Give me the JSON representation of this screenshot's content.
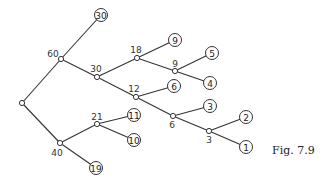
{
  "caption": "Fig. 7.9",
  "nodes": [
    {
      "id": "root",
      "type": "inner",
      "x": 22,
      "y": 103,
      "label": "",
      "lx": 0,
      "ly": 0
    },
    {
      "id": "n60",
      "type": "inner",
      "x": 61,
      "y": 59,
      "label": "60",
      "lx": 53,
      "ly": 57
    },
    {
      "id": "n30",
      "type": "inner",
      "x": 97,
      "y": 77,
      "label": "30",
      "lx": 96,
      "ly": 72
    },
    {
      "id": "n18",
      "type": "inner",
      "x": 137,
      "y": 58,
      "label": "18",
      "lx": 136,
      "ly": 53
    },
    {
      "id": "n9",
      "type": "inner",
      "x": 175,
      "y": 71,
      "label": "9",
      "lx": 175,
      "ly": 67
    },
    {
      "id": "n12",
      "type": "inner",
      "x": 136,
      "y": 97,
      "label": "12",
      "lx": 134,
      "ly": 92
    },
    {
      "id": "n6",
      "type": "inner",
      "x": 173,
      "y": 116,
      "label": "6",
      "lx": 172,
      "ly": 128
    },
    {
      "id": "n3",
      "type": "inner",
      "x": 209,
      "y": 131,
      "label": "3",
      "lx": 209,
      "ly": 143
    },
    {
      "id": "n40",
      "type": "inner",
      "x": 60,
      "y": 143,
      "label": "40",
      "lx": 57,
      "ly": 156
    },
    {
      "id": "n21",
      "type": "inner",
      "x": 97,
      "y": 124,
      "label": "21",
      "lx": 97,
      "ly": 120
    },
    {
      "id": "l30",
      "type": "leaf",
      "x": 101,
      "y": 15,
      "label": "30"
    },
    {
      "id": "l9",
      "type": "leaf",
      "x": 175,
      "y": 40,
      "label": "9"
    },
    {
      "id": "l5",
      "type": "leaf",
      "x": 212,
      "y": 53,
      "label": "5"
    },
    {
      "id": "l4",
      "type": "leaf",
      "x": 210,
      "y": 83,
      "label": "4"
    },
    {
      "id": "l6",
      "type": "leaf",
      "x": 174,
      "y": 86,
      "label": "6"
    },
    {
      "id": "l3",
      "type": "leaf",
      "x": 210,
      "y": 106,
      "label": "3"
    },
    {
      "id": "l2",
      "type": "leaf",
      "x": 246,
      "y": 117,
      "label": "2"
    },
    {
      "id": "l1",
      "type": "leaf",
      "x": 246,
      "y": 147,
      "label": "1"
    },
    {
      "id": "l11",
      "type": "leaf",
      "x": 134,
      "y": 115,
      "label": "11"
    },
    {
      "id": "l10",
      "type": "leaf",
      "x": 134,
      "y": 140,
      "label": "10"
    },
    {
      "id": "l19",
      "type": "leaf",
      "x": 96,
      "y": 168,
      "label": "19"
    }
  ],
  "edges": [
    [
      "root",
      "n60"
    ],
    [
      "root",
      "n40"
    ],
    [
      "n60",
      "l30"
    ],
    [
      "n60",
      "n30"
    ],
    [
      "n30",
      "n18"
    ],
    [
      "n30",
      "n12"
    ],
    [
      "n18",
      "l9"
    ],
    [
      "n18",
      "n9"
    ],
    [
      "n9",
      "l5"
    ],
    [
      "n9",
      "l4"
    ],
    [
      "n12",
      "l6"
    ],
    [
      "n12",
      "n6"
    ],
    [
      "n6",
      "l3"
    ],
    [
      "n6",
      "n3"
    ],
    [
      "n3",
      "l2"
    ],
    [
      "n3",
      "l1"
    ],
    [
      "n40",
      "n21"
    ],
    [
      "n40",
      "l19"
    ],
    [
      "n21",
      "l11"
    ],
    [
      "n21",
      "l10"
    ]
  ]
}
